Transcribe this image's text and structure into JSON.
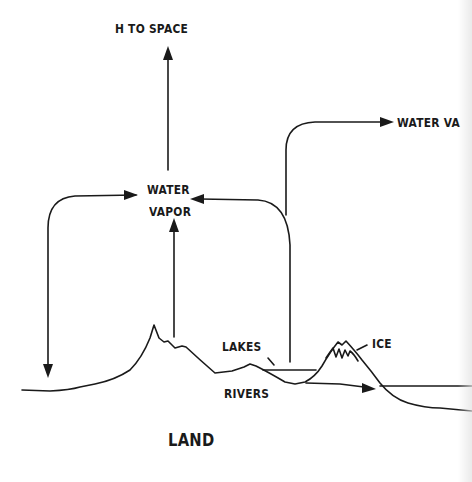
{
  "diagram": {
    "labels": {
      "h_to_space": "H TO SPACE",
      "water_vapor_right": "WATER VA",
      "water_vapor_center_line1": "WATER",
      "water_vapor_center_line2": "VAPOR",
      "lakes": "LAKES",
      "ice": "ICE",
      "rivers": "RIVERS",
      "land": "LAND"
    },
    "colors": {
      "ink": "#1a1a1a",
      "background": "#ffffff"
    },
    "flows": [
      {
        "from": "water_vapor",
        "to": "h_to_space",
        "direction": "up"
      },
      {
        "from": "lakes",
        "to": "water_vapor_right",
        "direction": "up-right"
      },
      {
        "from": "lakes",
        "to": "water_vapor",
        "direction": "left"
      },
      {
        "from": "water_vapor",
        "to": "land",
        "direction": "down-left"
      },
      {
        "from": "land",
        "to": "water_vapor",
        "direction": "up"
      },
      {
        "from": "rivers",
        "to": "ocean",
        "direction": "right"
      }
    ]
  }
}
